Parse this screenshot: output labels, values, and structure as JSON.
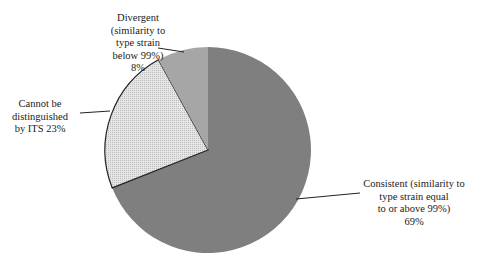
{
  "chart_data": {
    "type": "pie",
    "title": "",
    "categories": [
      "Consistent (similarity to type strain equal to or above 99%)",
      "Cannot be distinguished by ITS",
      "Divergent (similarity to type strain below 99%)"
    ],
    "values": [
      69,
      23,
      8
    ],
    "unit": "%",
    "colors": [
      "#7f7f7f",
      "#d9d9d9",
      "#a6a6a6"
    ],
    "patterns": [
      "solid",
      "dotted-hatch",
      "solid"
    ],
    "start_angle_deg": 0,
    "direction": "clockwise",
    "legend": "none (data labels with leader lines)",
    "labels": {
      "consistent": "Consistent (similarity to\ntype strain equal\nto or above 99%)\n69%",
      "cannot": "Cannot be\ndistinguished\nby ITS 23%",
      "divergent": "Divergent\n(similarity to\ntype strain\nbelow 99%)\n8%"
    }
  }
}
